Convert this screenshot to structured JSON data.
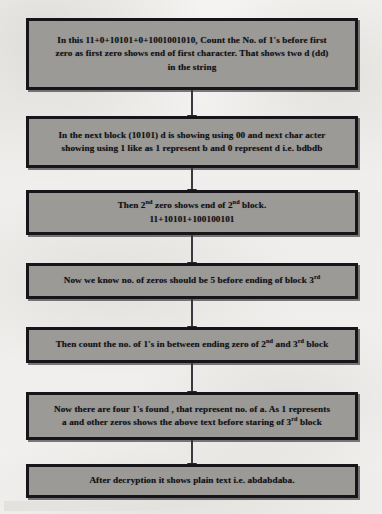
{
  "diagram": {
    "type": "flowchart",
    "orientation": "vertical",
    "colors": {
      "node_fill": "#9b9a97",
      "node_border": "#16161a",
      "text": "#101014",
      "background": "#f2f1ef",
      "arrow": "#3a3a3e"
    },
    "nodes": [
      {
        "id": "step-1",
        "name": "count-ones-before-first-zero",
        "text": "In this 11+0+10101+0+1001001010, Count the No. of 1's before first zero as first zero shows end of first character. That shows two d (dd) in the string",
        "lines": [
          "In this 11+0+10101+0+1001001010, Count the No. of 1's before first",
          "zero as first zero shows end of first character. That shows two d (dd)",
          "in the string"
        ],
        "binary_string": "11+0+10101+0+1001001010",
        "result": "dd"
      },
      {
        "id": "step-2",
        "name": "next-block-mapping",
        "text": "In the next block (10101) d is showing using 00 and next char acter showing using 1 like as 1 represent b and 0 represent d  i.e. bdbdb",
        "lines": [
          "In the next block (10101) d is showing using 00 and next char acter",
          "showing using 1 like as 1 represent b and 0 represent d  i.e. bdbdb"
        ],
        "block": "10101",
        "mapping": "1 represent b and 0 represent d",
        "result": "bdbdb"
      },
      {
        "id": "step-3",
        "name": "second-zero-ends-second-block",
        "text": "Then 2nd zero shows end of 2nd block. 11+10101+100100101",
        "line1_pre": "Then 2",
        "line1_sup1": "nd",
        "line1_mid": " zero shows end of 2",
        "line1_sup2": "nd",
        "line1_post": " block.",
        "line2": "11+10101+100100101",
        "binary_string": "11+10101+100100101"
      },
      {
        "id": "step-4",
        "name": "zeros-count-before-block-three",
        "text": "Now we know no. of zeros should be 5 before ending of block 3rd",
        "line_pre": "Now we know no. of zeros should be 5 before ending of block 3",
        "line_sup": "rd",
        "zero_count": "5"
      },
      {
        "id": "step-5",
        "name": "count-ones-between-blocks",
        "text": "Then count the no. of 1's in between ending zero of 2nd and 3rd block",
        "line_pre": "Then count the no. of 1's in between ending zero of 2",
        "line_sup1": "nd",
        "line_mid": " and 3",
        "line_sup2": "rd",
        "line_post": " block"
      },
      {
        "id": "step-6",
        "name": "four-ones-represent-a",
        "text": "Now there are four 1's found , that represent no. of a. As 1 represents a and other zeros shows the above text before staring of 3rd block",
        "line1": "Now there are four 1's found , that represent no. of a. As 1 represents",
        "line2_pre": "a and other zeros shows the above text before staring of 3",
        "line2_sup": "rd",
        "line2_post": " block",
        "ones_count": "four"
      },
      {
        "id": "step-7",
        "name": "final-plain-text",
        "text": "After decryption it shows plain text i.e. abdabdaba.",
        "plain_text": "abdabdaba"
      }
    ],
    "edges": [
      {
        "from": "step-1",
        "to": "step-2",
        "kind": "arrow-down"
      },
      {
        "from": "step-2",
        "to": "step-3",
        "kind": "arrow-down"
      },
      {
        "from": "step-3",
        "to": "step-4",
        "kind": "arrow-down"
      },
      {
        "from": "step-4",
        "to": "step-5",
        "kind": "arrow-down"
      },
      {
        "from": "step-5",
        "to": "step-6",
        "kind": "arrow-down"
      },
      {
        "from": "step-6",
        "to": "step-7",
        "kind": "arrow-down"
      }
    ]
  }
}
